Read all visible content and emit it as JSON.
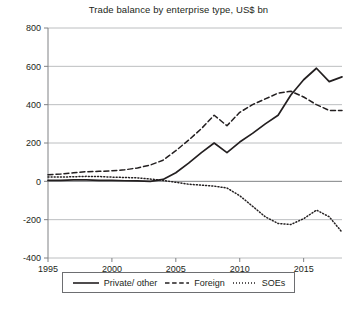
{
  "chart_data": {
    "type": "line",
    "title": "Trade balance by enterprise type, US$ bn",
    "xlabel": "",
    "ylabel": "",
    "xlim": [
      1995,
      2018
    ],
    "ylim": [
      -400,
      800
    ],
    "ytick_labels": [
      "800",
      "600",
      "400",
      "200",
      "0",
      "-200",
      "-400"
    ],
    "yticks": [
      800,
      600,
      400,
      200,
      0,
      -200,
      -400
    ],
    "xtick_labels": [
      "1995",
      "2000",
      "2005",
      "2010",
      "2015"
    ],
    "xticks": [
      1995,
      2000,
      2005,
      2010,
      2015
    ],
    "grid": "horizontal",
    "legend_position": "below-axes",
    "x": [
      1995,
      1996,
      1997,
      1998,
      1999,
      2000,
      2001,
      2002,
      2003,
      2004,
      2005,
      2006,
      2007,
      2008,
      2009,
      2010,
      2011,
      2012,
      2013,
      2014,
      2015,
      2016,
      2017,
      2018
    ],
    "series": [
      {
        "name": "Private/ other",
        "style": "solid",
        "color": "#231f20",
        "values": [
          5,
          5,
          8,
          8,
          5,
          5,
          3,
          2,
          0,
          10,
          45,
          95,
          150,
          200,
          150,
          205,
          250,
          300,
          345,
          450,
          530,
          590,
          520,
          545
        ]
      },
      {
        "name": "Foreign",
        "style": "dashed",
        "color": "#231f20",
        "values": [
          35,
          38,
          45,
          50,
          52,
          55,
          60,
          70,
          85,
          110,
          160,
          215,
          275,
          345,
          290,
          360,
          400,
          430,
          460,
          470,
          440,
          400,
          370,
          370
        ]
      },
      {
        "name": "SOEs",
        "style": "dotted",
        "color": "#231f20",
        "values": [
          22,
          22,
          24,
          26,
          25,
          22,
          20,
          18,
          12,
          5,
          -5,
          -15,
          -20,
          -25,
          -35,
          -75,
          -130,
          -185,
          -220,
          -225,
          -195,
          -150,
          -185,
          -265
        ]
      }
    ]
  },
  "legend": {
    "items": [
      {
        "label": "Private/ other",
        "style": "solid"
      },
      {
        "label": "Foreign",
        "style": "dashed"
      },
      {
        "label": "SOEs",
        "style": "dotted"
      }
    ]
  },
  "caption": {
    "text": ""
  }
}
